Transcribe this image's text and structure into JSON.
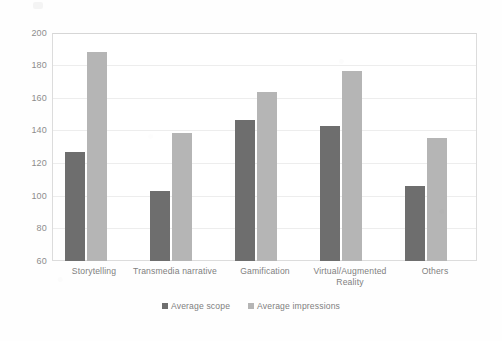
{
  "chart_data": {
    "type": "bar",
    "title": "",
    "xlabel": "",
    "ylabel": "",
    "ylim": [
      60,
      200
    ],
    "ytick_step": 20,
    "yticks": [
      "200",
      "180",
      "160",
      "140",
      "120",
      "100",
      "80",
      "60"
    ],
    "grid": true,
    "legend_position": "bottom-center",
    "categories": [
      "Storytelling",
      "Transmedia narrative",
      "Gamification",
      "Virtual/Augmented Reality",
      "Others"
    ],
    "series": [
      {
        "name": "Average scope",
        "color": "#6e6e6e",
        "values": [
          127,
          103,
          147,
          143,
          106
        ]
      },
      {
        "name": "Average impressions",
        "color": "#b5b5b5",
        "values": [
          189,
          139,
          164,
          177,
          136
        ]
      }
    ]
  },
  "legend": {
    "items": [
      {
        "label": "Average scope",
        "color": "#6e6e6e"
      },
      {
        "label": "Average impressions",
        "color": "#b5b5b5"
      }
    ]
  },
  "axis": {
    "y_min": 60,
    "y_max": 200
  }
}
